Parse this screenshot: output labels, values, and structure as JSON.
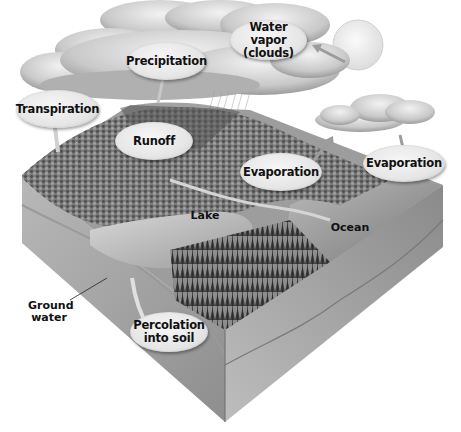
{
  "diagram": {
    "style": "grayscale block-diagram illustration",
    "bubble_labels": {
      "water_vapor": "Water vapor\n(clouds)",
      "water_vapor_line1": "Water vapor",
      "water_vapor_line2": "(clouds)",
      "precipitation": "Precipitation",
      "transpiration": "Transpiration",
      "runoff": "Runoff",
      "evaporation_land": "Evaporation",
      "evaporation_ocean": "Evaporation",
      "percolation_line1": "Percolation",
      "percolation_line2": "into soil"
    },
    "plain_labels": {
      "lake": "Lake",
      "ocean": "Ocean",
      "ground_water_line1": "Ground",
      "ground_water_line2": "water"
    },
    "elements": [
      "sun",
      "storm cloud",
      "small cloud",
      "rain",
      "forested hills",
      "lake",
      "river",
      "conifer forest",
      "ocean",
      "soil layers",
      "ground water"
    ],
    "colors": {
      "bubble_fill": "#e6e6e6",
      "text": "#111111",
      "background": "#ffffff"
    }
  }
}
